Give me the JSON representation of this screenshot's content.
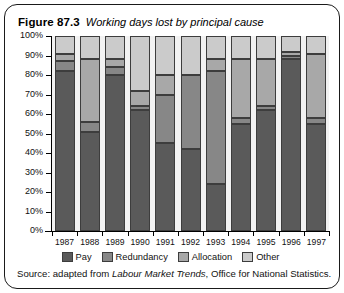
{
  "figure": {
    "number": "Figure 87.3",
    "caption": "Working days lost by principal cause"
  },
  "source": {
    "prefix": "Source: adapted from ",
    "italic": "Labour Market Trends",
    "suffix": ", Office for National Statistics."
  },
  "legend": {
    "items": [
      {
        "label": "Pay",
        "color": "#5a5a5a"
      },
      {
        "label": "Redundancy",
        "color": "#878787"
      },
      {
        "label": "Allocation",
        "color": "#a8a8a8"
      },
      {
        "label": "Other",
        "color": "#cbcbcb"
      }
    ]
  },
  "chart_data": {
    "type": "bar",
    "subtype": "stacked-percentage-column",
    "title": "Working days lost by principal cause",
    "xlabel": "",
    "ylabel": "",
    "ylim": [
      0,
      100
    ],
    "yticks": [
      0,
      10,
      20,
      30,
      40,
      50,
      60,
      70,
      80,
      90,
      100
    ],
    "ytick_labels": [
      "0%",
      "10%",
      "20%",
      "30%",
      "40%",
      "50%",
      "60%",
      "70%",
      "80%",
      "90%",
      "100%"
    ],
    "grid": false,
    "legend_position": "bottom",
    "categories": [
      "1987",
      "1988",
      "1989",
      "1990",
      "1991",
      "1992",
      "1993",
      "1994",
      "1995",
      "1996",
      "1997"
    ],
    "series": [
      {
        "name": "Pay",
        "color": "#5a5a5a",
        "values": [
          82,
          51,
          80,
          62,
          45,
          42,
          24,
          55,
          62,
          88,
          55
        ]
      },
      {
        "name": "Redundancy",
        "color": "#878787",
        "values": [
          5,
          5,
          4,
          2,
          25,
          38,
          58,
          3,
          2,
          2,
          3
        ]
      },
      {
        "name": "Allocation",
        "color": "#a8a8a8",
        "values": [
          4,
          32,
          4,
          8,
          10,
          0,
          6,
          30,
          24,
          2,
          33
        ]
      },
      {
        "name": "Other",
        "color": "#cbcbcb",
        "values": [
          9,
          12,
          12,
          28,
          20,
          20,
          12,
          12,
          12,
          8,
          9
        ]
      }
    ]
  }
}
